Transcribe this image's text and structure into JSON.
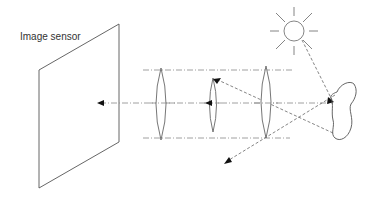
{
  "diagram": {
    "labels": {
      "image_sensor": "Image sensor"
    },
    "components": [
      {
        "id": "sun",
        "type": "light-source"
      },
      {
        "id": "object",
        "type": "irregular-object"
      },
      {
        "id": "lens-1",
        "type": "convex-lens"
      },
      {
        "id": "lens-2",
        "type": "convex-lens"
      },
      {
        "id": "lens-3",
        "type": "convex-lens"
      },
      {
        "id": "image-sensor",
        "type": "plane"
      }
    ],
    "rays": [
      {
        "from": "sun",
        "to": "object"
      },
      {
        "from": "object",
        "to": "image-sensor",
        "via": [
          "lens-3",
          "lens-2",
          "lens-1"
        ]
      },
      {
        "from": "object",
        "to": "lens-2-top"
      },
      {
        "from": "object",
        "to": "lower-left",
        "via": [
          "lens-3-bottom"
        ]
      }
    ],
    "colors": {
      "line": "#555555",
      "axis": "#888888",
      "arrowhead": "#111111",
      "background": "#ffffff"
    }
  }
}
